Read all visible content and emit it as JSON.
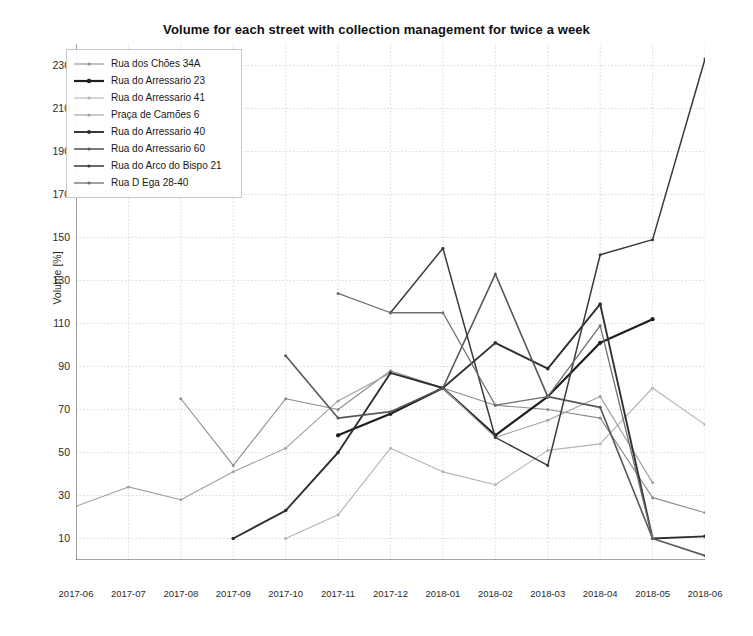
{
  "chart_data": {
    "type": "line",
    "title": "Volume for each street with collection management for twice a week",
    "xlabel": "",
    "ylabel": "Volume [%]",
    "grid": true,
    "legend_position": "upper-left",
    "categories": [
      "2017-06",
      "2017-07",
      "2017-08",
      "2017-09",
      "2017-10",
      "2017-11",
      "2017-12",
      "2018-01",
      "2018-02",
      "2018-03",
      "2018-04",
      "2018-05",
      "2018-06"
    ],
    "ylim": [
      0,
      240
    ],
    "yticks": [
      10,
      30,
      50,
      70,
      90,
      110,
      130,
      150,
      170,
      190,
      210,
      230
    ],
    "xlim_index": [
      0,
      12
    ],
    "series": [
      {
        "name": "Rua dos Chões 34A",
        "color": "#8c8c8c",
        "width": 1.1,
        "values": [
          null,
          null,
          75,
          44,
          75,
          70,
          88,
          80,
          72,
          70,
          66,
          29,
          22
        ]
      },
      {
        "name": "Rua do Arressario 23",
        "color": "#1e1e1e",
        "width": 2.2,
        "values": [
          null,
          null,
          null,
          null,
          null,
          58,
          68,
          80,
          58,
          76,
          101,
          112,
          null
        ]
      },
      {
        "name": "Rua do Arressario 41",
        "color": "#b4b4b4",
        "width": 1.1,
        "values": [
          null,
          null,
          null,
          null,
          10,
          21,
          52,
          41,
          35,
          51,
          54,
          80,
          63
        ]
      },
      {
        "name": "Praça de Camões 6",
        "color": "#a0a0a0",
        "width": 1.1,
        "values": [
          25,
          34,
          28,
          41,
          52,
          74,
          87,
          80,
          57,
          65,
          76,
          36,
          null
        ]
      },
      {
        "name": "Rua do Arressario 40",
        "color": "#303030",
        "width": 1.9,
        "values": [
          null,
          null,
          null,
          10,
          23,
          50,
          87,
          80,
          101,
          89,
          119,
          10,
          11
        ]
      },
      {
        "name": "Rua do Arressario 60",
        "color": "#585858",
        "width": 1.6,
        "values": [
          null,
          null,
          null,
          null,
          95,
          66,
          69,
          80,
          133,
          76,
          71,
          10,
          2
        ]
      },
      {
        "name": "Rua do Arco do Bispo 21",
        "color": "#3a3a3a",
        "width": 1.5,
        "values": [
          null,
          null,
          null,
          null,
          null,
          null,
          115,
          145,
          57,
          44,
          142,
          149,
          233
        ]
      },
      {
        "name": "Rua D Ega 28-40",
        "color": "#6e6e6e",
        "width": 1.3,
        "values": [
          null,
          null,
          null,
          null,
          null,
          124,
          115,
          115,
          72,
          76,
          109,
          10,
          null
        ]
      }
    ]
  }
}
